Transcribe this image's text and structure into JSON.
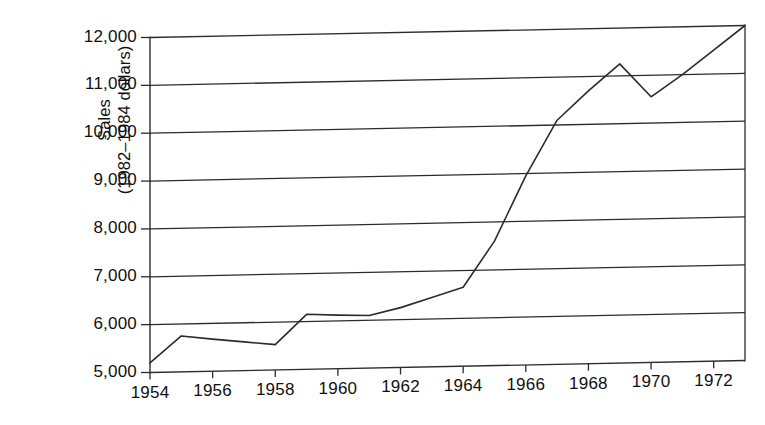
{
  "chart_data": {
    "type": "line",
    "title": "",
    "subtitle": "",
    "xlabel": "",
    "ylabel": "Sales (1982–1984 dollars)",
    "ylabel_lines": [
      "Sales",
      "(1982–1984 dollars)"
    ],
    "x": [
      1954,
      1955,
      1956,
      1957,
      1958,
      1959,
      1960,
      1961,
      1962,
      1963,
      1964,
      1965,
      1966,
      1967,
      1968,
      1969,
      1970,
      1971,
      1972,
      1973
    ],
    "values": [
      5200,
      5750,
      5670,
      5600,
      5530,
      6150,
      6120,
      6100,
      6250,
      6450,
      6650,
      7600,
      8950,
      10100,
      10700,
      11250,
      10550,
      11000,
      11500,
      12000
    ],
    "series": [
      {
        "name": "Sales",
        "values": [
          5200,
          5750,
          5670,
          5600,
          5530,
          6150,
          6120,
          6100,
          6250,
          6450,
          6650,
          7600,
          8950,
          10100,
          10700,
          11250,
          10550,
          11000,
          11500,
          12000
        ]
      }
    ],
    "xlim": [
      1954,
      1973
    ],
    "ylim": [
      5000,
      12000
    ],
    "xtick_labels": [
      "1954",
      "1956",
      "1958",
      "1960",
      "1962",
      "1964",
      "1966",
      "1968",
      "1970",
      "1972"
    ],
    "xticks": [
      1954,
      1956,
      1958,
      1960,
      1962,
      1964,
      1966,
      1968,
      1970,
      1972
    ],
    "ytick_labels": [
      "5,000",
      "6,000",
      "7,000",
      "8,000",
      "9,000",
      "10,000",
      "11,000",
      "12,000"
    ],
    "yticks": [
      5000,
      6000,
      7000,
      8000,
      9000,
      10000,
      11000,
      12000
    ],
    "grid": "horizontal",
    "legend": "none",
    "line_color": "#2b2b2b",
    "axis_color": "#2b2b2b",
    "background_color": "#ffffff"
  }
}
